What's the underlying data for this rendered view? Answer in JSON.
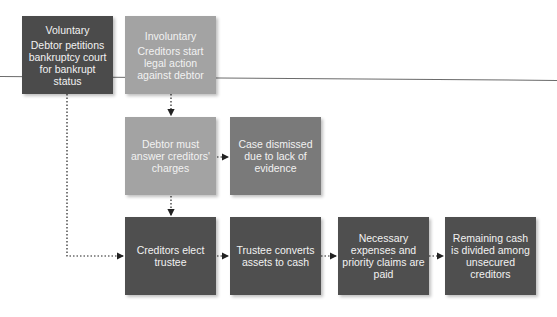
{
  "diagram": {
    "nodes": {
      "voluntary": {
        "title": "Voluntary",
        "text": "Debtor petitions bankruptcy court for bankrupt status"
      },
      "involuntary": {
        "title": "Involuntary",
        "text": "Creditors start legal action against debtor"
      },
      "debtor_answer": {
        "text": "Debtor must answer creditors' charges"
      },
      "case_dismissed": {
        "text": "Case dismissed due to lack of evidence"
      },
      "elect_trustee": {
        "text": "Creditors elect trustee"
      },
      "trustee_converts": {
        "text": "Trustee converts assets to cash"
      },
      "priority_claims": {
        "text": "Necessary expenses and priority claims are paid"
      },
      "remaining_cash": {
        "text": "Remaining cash is divided among unsecured creditors"
      }
    },
    "edges": [
      {
        "from": "voluntary",
        "to": "elect_trustee"
      },
      {
        "from": "involuntary",
        "to": "debtor_answer"
      },
      {
        "from": "debtor_answer",
        "to": "case_dismissed"
      },
      {
        "from": "debtor_answer",
        "to": "elect_trustee"
      },
      {
        "from": "elect_trustee",
        "to": "trustee_converts"
      },
      {
        "from": "trustee_converts",
        "to": "priority_claims"
      },
      {
        "from": "priority_claims",
        "to": "remaining_cash"
      }
    ],
    "colors": {
      "dark": "#4b4b4b",
      "light": "#a3a3a3",
      "mid": "#7a7a7a",
      "bottom": "#4f4f4f",
      "connector": "#222222"
    }
  }
}
